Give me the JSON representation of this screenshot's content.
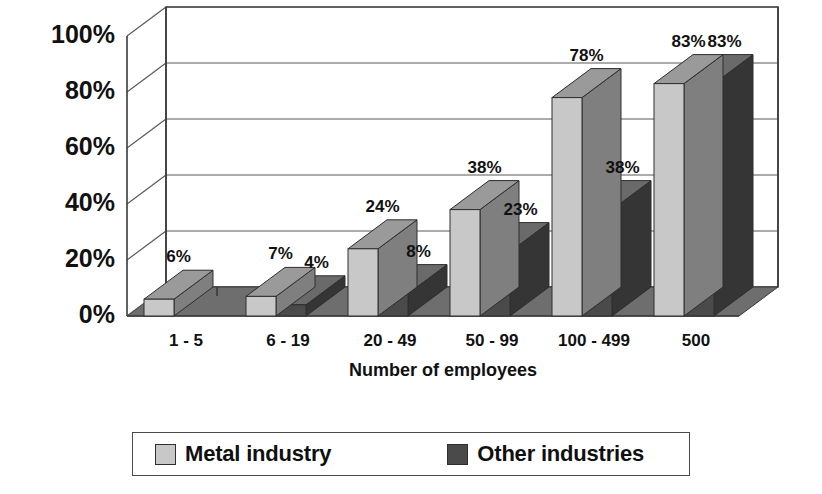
{
  "chart_data": {
    "type": "bar",
    "title": "",
    "subtitle": "",
    "xlabel": "Number of employees",
    "ylabel": "",
    "categories": [
      "1 - 5",
      "6 - 19",
      "20 - 49",
      "50 - 99",
      "100 - 499",
      "500"
    ],
    "series": [
      {
        "name": "Metal industry",
        "color": "#c8c8c8",
        "values": [
          6,
          7,
          24,
          38,
          78,
          83
        ],
        "labels": [
          "6%",
          "7%",
          "24%",
          "38%",
          "78%",
          "83%"
        ]
      },
      {
        "name": "Other industries",
        "color": "#4a4a4a",
        "values": [
          0,
          4,
          8,
          23,
          38,
          83
        ],
        "labels": [
          "",
          "4%",
          "8%",
          "23%",
          "38%",
          "83%"
        ]
      }
    ],
    "ylim": [
      0,
      100
    ],
    "yticks": [
      0,
      20,
      40,
      60,
      80,
      100
    ],
    "ytick_labels": [
      "0%",
      "20%",
      "40%",
      "60%",
      "80%",
      "100%"
    ],
    "grid": true,
    "legend_position": "bottom",
    "style": "3d-column"
  },
  "axis": {
    "y": {
      "labels": [
        "100%",
        "80%",
        "60%",
        "40%",
        "20%",
        "0%"
      ]
    },
    "x": {
      "labels": [
        "1 - 5",
        "6 - 19",
        "20 - 49",
        "50 - 99",
        "100 - 499",
        "500"
      ],
      "title": "Number of employees"
    }
  },
  "legend": {
    "items": [
      {
        "label": "Metal industry",
        "color": "#c8c8c8"
      },
      {
        "label": "Other industries",
        "color": "#4a4a4a"
      }
    ]
  },
  "colors": {
    "metal_front": "#c8c8c8",
    "metal_top": "#9a9a9a",
    "metal_side": "#7f7f7f",
    "other_front": "#4a4a4a",
    "other_top": "#6a6a6a",
    "other_side": "#353535",
    "floor": "#6e6e6e",
    "outline": "#2e2e2e",
    "grid": "#5a5a5a",
    "text": "#111111"
  }
}
